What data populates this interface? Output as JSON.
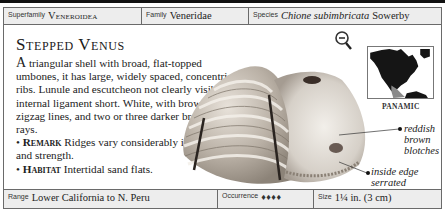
{
  "header": {
    "superfamily": {
      "label": "Superfamily",
      "value": "Veneroidea"
    },
    "family": {
      "label": "Family",
      "value": "Veneridae"
    },
    "species": {
      "label": "Species",
      "name": "Chione subimbricata",
      "author": "Sowerby"
    }
  },
  "entry": {
    "title": "Stepped Venus",
    "description_dropcap": "A",
    "description": " triangular shell with broad, flat-topped umbones, it has large, widely spaced, concentric ribs. Lunule and escutcheon not clearly visible; internal ligament short. White, with brown zigzag lines, and two or three darker brown rays.",
    "remark_label": "Remark",
    "remark": " Ridges vary considerably in number and strength.",
    "habitat_label": "Habitat",
    "habitat": " Intertidal sand flats."
  },
  "map": {
    "region_label": "PANAMIC"
  },
  "annotations": [
    {
      "text": "reddish brown blotches"
    },
    {
      "text": "inside edge serrated"
    }
  ],
  "footer": {
    "range": {
      "label": "Range",
      "value": "Lower California to N. Peru"
    },
    "occurrence": {
      "label": "Occurrence",
      "icon_count": 4,
      "icons": "♦♦♦♦"
    },
    "size": {
      "label": "Size",
      "value": "1¼ in. (3 cm)"
    }
  },
  "icons": {
    "zoom": "magnifier-minus-icon",
    "occurrence": "shell-icon"
  }
}
